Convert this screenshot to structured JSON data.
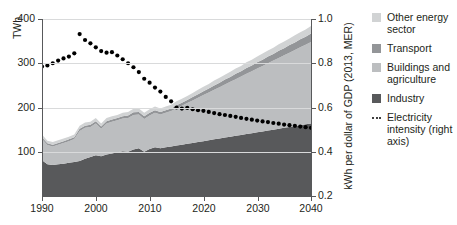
{
  "chart_data": {
    "type": "area",
    "title": "",
    "xlabel": "",
    "ylabel": "TWh",
    "ylabel_right": "kWh per dollar of GDP (2013, MER)",
    "xlim": [
      1990,
      2040
    ],
    "ylim": [
      0,
      400
    ],
    "ylim_right": [
      0.2,
      1.0
    ],
    "grid": true,
    "legend_position": "right",
    "stacked": true,
    "x": [
      1990,
      1991,
      1992,
      1993,
      1994,
      1995,
      1996,
      1997,
      1998,
      1999,
      2000,
      2001,
      2002,
      2003,
      2004,
      2005,
      2006,
      2007,
      2008,
      2009,
      2010,
      2011,
      2012,
      2013,
      2014,
      2015,
      2016,
      2017,
      2018,
      2019,
      2020,
      2021,
      2022,
      2023,
      2024,
      2025,
      2026,
      2027,
      2028,
      2029,
      2030,
      2031,
      2032,
      2033,
      2034,
      2035,
      2036,
      2037,
      2038,
      2039,
      2040
    ],
    "x_ticks": [
      1990,
      2000,
      2010,
      2020,
      2030,
      2040
    ],
    "y_ticks_left": [
      100,
      200,
      300,
      400
    ],
    "y_ticks_right": [
      0.2,
      0.4,
      0.6,
      0.8,
      1.0
    ],
    "series": [
      {
        "name": "Industry",
        "color": "#58595b",
        "values": [
          81,
          72,
          70,
          72,
          73,
          75,
          77,
          79,
          84,
          88,
          92,
          90,
          94,
          96,
          99,
          101,
          100,
          105,
          108,
          100,
          106,
          110,
          108,
          110,
          112,
          114,
          116,
          118,
          120,
          122,
          124,
          126,
          128,
          130,
          132,
          134,
          136,
          138,
          140,
          142,
          144,
          146,
          148,
          150,
          152,
          154,
          156,
          158,
          160,
          162,
          164
        ]
      },
      {
        "name": "Buildings and agriculture",
        "color": "#bcbec0",
        "values": [
          48,
          43,
          42,
          44,
          47,
          49,
          52,
          68,
          70,
          68,
          72,
          62,
          70,
          72,
          72,
          74,
          76,
          78,
          76,
          74,
          76,
          78,
          76,
          78,
          80,
          84,
          88,
          92,
          96,
          100,
          104,
          108,
          112,
          116,
          120,
          124,
          128,
          132,
          136,
          140,
          144,
          148,
          152,
          156,
          160,
          164,
          168,
          172,
          176,
          180,
          184
        ]
      },
      {
        "name": "Transport",
        "color": "#939598",
        "values": [
          4,
          4,
          4,
          4,
          4,
          4,
          4,
          5,
          5,
          5,
          5,
          5,
          5,
          5,
          5,
          5,
          6,
          6,
          6,
          6,
          6,
          6,
          6,
          6,
          6,
          7,
          7,
          7,
          8,
          8,
          9,
          9,
          10,
          10,
          11,
          11,
          12,
          12,
          13,
          13,
          14,
          14,
          15,
          15,
          16,
          16,
          17,
          17,
          18,
          18,
          19
        ]
      },
      {
        "name": "Other energy sector",
        "color": "#d1d3d4",
        "values": [
          6,
          6,
          6,
          6,
          6,
          6,
          6,
          7,
          7,
          7,
          7,
          7,
          7,
          7,
          7,
          8,
          8,
          8,
          8,
          8,
          8,
          8,
          8,
          8,
          8,
          9,
          9,
          9,
          9,
          10,
          10,
          10,
          11,
          11,
          11,
          12,
          12,
          12,
          13,
          13,
          13,
          14,
          14,
          14,
          15,
          15,
          15,
          16,
          16,
          16,
          17
        ]
      }
    ],
    "line_series": {
      "name": "Electricity intensity (right axis)",
      "color": "#000000",
      "style": "dotted",
      "axis": "right",
      "values": [
        0.785,
        0.79,
        0.8,
        0.812,
        0.822,
        0.83,
        0.845,
        0.932,
        0.905,
        0.89,
        0.872,
        0.855,
        0.848,
        0.85,
        0.835,
        0.818,
        0.8,
        0.782,
        0.76,
        0.73,
        0.712,
        0.69,
        0.672,
        0.648,
        0.628,
        0.6,
        0.595,
        0.598,
        0.592,
        0.588,
        0.585,
        0.58,
        0.575,
        0.57,
        0.566,
        0.562,
        0.558,
        0.553,
        0.549,
        0.545,
        0.541,
        0.537,
        0.534,
        0.53,
        0.527,
        0.523,
        0.52,
        0.517,
        0.514,
        0.511,
        0.508
      ]
    }
  },
  "axes": {
    "left_title": "TWh",
    "right_title": "kWh per dollar of GDP (2013, MER)",
    "left_ticks": [
      "400",
      "300",
      "200",
      "100"
    ],
    "right_ticks": [
      "1.0",
      "0.8",
      "0.6",
      "0.4",
      "0.2"
    ],
    "x_ticks": [
      "1990",
      "2000",
      "2010",
      "2020",
      "2030",
      "2040"
    ]
  },
  "legend": {
    "items": [
      {
        "label": "Other energy sector",
        "color": "#d1d3d4",
        "type": "swatch"
      },
      {
        "label": "Transport",
        "color": "#939598",
        "type": "swatch"
      },
      {
        "label": "Buildings and agriculture",
        "color": "#bcbec0",
        "type": "swatch"
      },
      {
        "label": "Industry",
        "color": "#58595b",
        "type": "swatch"
      },
      {
        "label": "Electricity intensity (right axis)",
        "color": "#000000",
        "type": "dots"
      }
    ]
  }
}
